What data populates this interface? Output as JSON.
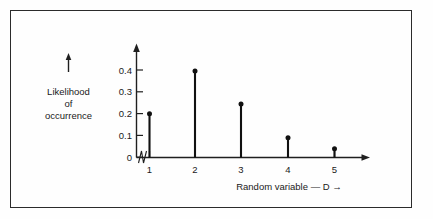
{
  "chart_data": {
    "type": "bar",
    "subtype": "stem-plot",
    "title": "",
    "xlabel": "Random variable — D  →",
    "ylabel": "Likelihood of occurrence",
    "ylabel_lines": [
      "Likelihood",
      "of",
      "occurrence"
    ],
    "categories": [
      "1",
      "2",
      "3",
      "4",
      "5"
    ],
    "x": [
      1,
      2,
      3,
      4,
      5
    ],
    "values": [
      0.2,
      0.395,
      0.245,
      0.09,
      0.04
    ],
    "xlim": [
      1,
      5
    ],
    "ylim": [
      0,
      0.44
    ],
    "y_ticks": [
      0,
      0.1,
      0.2,
      0.3,
      0.4
    ],
    "y_tick_labels": [
      "0",
      "0.1",
      "0.2",
      "0.3",
      "0.4"
    ],
    "x_ticks": [
      1,
      2,
      3,
      4,
      5
    ],
    "x_tick_labels": [
      "1",
      "2",
      "3",
      "4",
      "5"
    ],
    "grid": false,
    "legend": null,
    "axis_break": true,
    "axis_break_note": "zigzag break between 0 and 1 on the x axis",
    "marker": "filled-circle",
    "colors": {
      "stem": "#111111",
      "axis": "#1f1f1f",
      "frame": "#2b2b2b",
      "background": "#fefefe"
    }
  },
  "labels": {
    "y_axis_arrow": "↑",
    "y_title_line1": "Likelihood",
    "y_title_line2": "of",
    "y_title_line3": "occurrence",
    "x_axis_title": "Random variable — D",
    "x_axis_arrow": "→",
    "tick_0": "0",
    "tick_01": "0.1",
    "tick_02": "0.2",
    "tick_03": "0.3",
    "tick_04": "0.4",
    "xtick_1": "1",
    "xtick_2": "2",
    "xtick_3": "3",
    "xtick_4": "4",
    "xtick_5": "5"
  }
}
